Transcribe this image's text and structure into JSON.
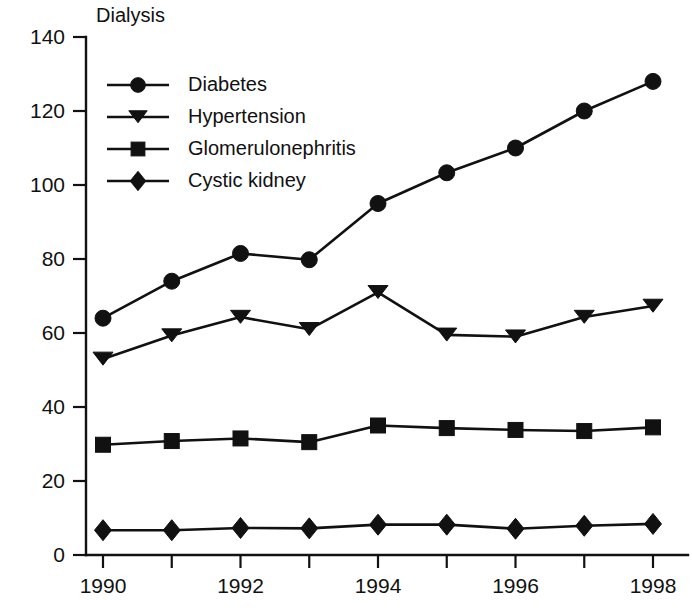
{
  "chart_data": {
    "type": "line",
    "title": "Dialysis",
    "xlabel": "",
    "ylabel": "",
    "xlim": [
      1990,
      1998
    ],
    "ylim": [
      0,
      140
    ],
    "ytick_values": [
      0,
      20,
      40,
      60,
      80,
      100,
      120,
      140
    ],
    "ytick_labels": [
      "0",
      "20",
      "40",
      "60",
      "80",
      "100",
      "120",
      "140"
    ],
    "xtick_values": [
      1990,
      1991,
      1992,
      1993,
      1994,
      1995,
      1996,
      1997,
      1998
    ],
    "xtick_labels": [
      "1990",
      "",
      "1992",
      "",
      "1994",
      "",
      "1996",
      "",
      "1998"
    ],
    "x": [
      1990,
      1991,
      1992,
      1993,
      1994,
      1995,
      1996,
      1997,
      1998
    ],
    "grid": false,
    "legend_position": "upper-left",
    "series": [
      {
        "name": "Diabetes",
        "marker": "circle",
        "color": "#111111",
        "values": [
          64,
          74,
          81.5,
          79.8,
          95,
          103.3,
          110,
          120,
          128
        ]
      },
      {
        "name": "Hypertension",
        "marker": "triangle-down",
        "color": "#111111",
        "values": [
          53,
          59.3,
          64.3,
          61,
          71,
          59.5,
          59,
          64.3,
          67.3
        ]
      },
      {
        "name": "Glomerulonephritis",
        "marker": "square",
        "color": "#111111",
        "values": [
          29.8,
          30.8,
          31.5,
          30.5,
          35,
          34.3,
          33.8,
          33.5,
          34.5
        ]
      },
      {
        "name": "Cystic kidney",
        "marker": "diamond",
        "color": "#111111",
        "values": [
          6.7,
          6.7,
          7.3,
          7.2,
          8.2,
          8.2,
          7.1,
          7.9,
          8.4
        ]
      }
    ]
  }
}
